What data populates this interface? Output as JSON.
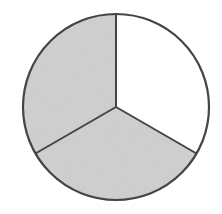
{
  "chart_data": {
    "type": "pie",
    "title": "",
    "categories": [
      "Unshaded",
      "Shaded (bottom)",
      "Shaded (left)"
    ],
    "values": [
      1,
      1,
      1
    ],
    "fractions": [
      "1/3",
      "1/3",
      "1/3"
    ],
    "angles_deg": [
      120,
      120,
      120
    ],
    "shaded": [
      false,
      true,
      true
    ],
    "start_angle": "12 o'clock, clockwise",
    "legend": null
  },
  "figure": {
    "center": [
      116,
      107
    ],
    "radius": 93,
    "colors": {
      "outline": "#444444",
      "shaded_fill": "#d2d2d2",
      "unshaded_fill": "#ffffff"
    }
  }
}
